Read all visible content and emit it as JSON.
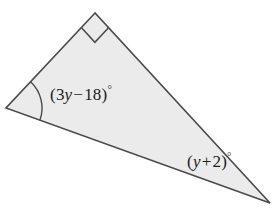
{
  "figure": {
    "kind": "right-triangle-diagram",
    "background_color": "#ffffff",
    "fill_color": "#ebebeb",
    "stroke_color": "#4a4a4a",
    "stroke_width": 1.6,
    "vertices": {
      "apex": {
        "label": "top vertex",
        "x": 95,
        "y": 13
      },
      "left": {
        "label": "left vertex",
        "x": 6,
        "y": 108
      },
      "right": {
        "label": "bottom right vertex",
        "x": 270,
        "y": 203
      }
    },
    "markers": {
      "right_angle": {
        "name": "right-angle-square",
        "at_vertex": "apex",
        "size": 20
      },
      "angle_arc": {
        "name": "angle-arc",
        "at_vertex": "left",
        "radius": 36
      }
    }
  },
  "labels": {
    "interior_angle": {
      "name": "interior angle expression at left vertex",
      "open_paren": "(",
      "coefficient": "3",
      "variable": "y",
      "operator": "−",
      "constant": "18",
      "close_paren": ")",
      "degree": "°",
      "full_text": "(3y − 18)°"
    },
    "bottom_right_angle": {
      "name": "angle expression at bottom right vertex",
      "open_paren": "(",
      "variable": "y",
      "operator": "+",
      "constant": "2",
      "close_paren": ")",
      "degree": "°",
      "full_text": "(y + 2)°"
    }
  }
}
